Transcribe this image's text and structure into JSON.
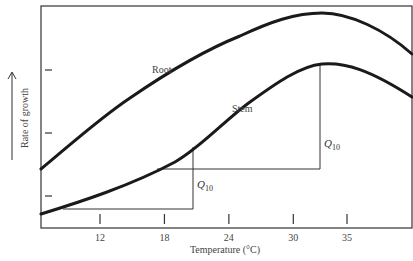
{
  "chart_data": {
    "type": "line",
    "title": "",
    "xlabel": "Temperature (°C)",
    "ylabel": "Rate of growth",
    "ylabel_arrow": "up-arrow",
    "xlim": [
      7,
      42
    ],
    "ylim": [
      0,
      10
    ],
    "x_ticks": [
      12,
      18,
      24,
      30,
      35
    ],
    "x_tick_labels": [
      "12",
      "18",
      "24",
      "30",
      "35"
    ],
    "y_ticks": [
      2.5,
      5.3,
      8.2
    ],
    "y_tick_labels": [
      "",
      "",
      ""
    ],
    "grid": false,
    "legend": "none",
    "series": [
      {
        "name": "Root",
        "x": [
          7,
          9,
          12,
          15,
          18,
          21,
          24,
          27,
          30,
          32,
          34,
          36,
          38,
          40,
          42
        ],
        "y": [
          2.7,
          3.6,
          5.0,
          6.3,
          7.5,
          8.5,
          9.2,
          9.7,
          9.95,
          10.0,
          9.9,
          9.5,
          8.9,
          8.2,
          7.6
        ]
      },
      {
        "name": "Stem",
        "x": [
          7,
          9,
          12,
          15,
          18,
          21,
          24,
          27,
          30,
          32,
          34,
          36,
          38,
          40,
          42
        ],
        "y": [
          0.65,
          0.95,
          1.45,
          2.1,
          2.9,
          3.9,
          5.0,
          6.1,
          7.1,
          7.5,
          7.6,
          7.5,
          7.1,
          6.5,
          5.7
        ]
      }
    ],
    "annotations": [
      {
        "text": "Root",
        "series": "Root"
      },
      {
        "text": "Stem",
        "series": "Stem"
      },
      {
        "text": "Q10",
        "type": "bracket",
        "x_from": 9,
        "x_to": 21,
        "y_from": 0.9,
        "y_to": 3.9
      },
      {
        "text": "Q10",
        "type": "bracket",
        "x_from": 17.5,
        "x_to": 32.5,
        "y_from": 2.7,
        "y_to": 7.6
      }
    ]
  }
}
